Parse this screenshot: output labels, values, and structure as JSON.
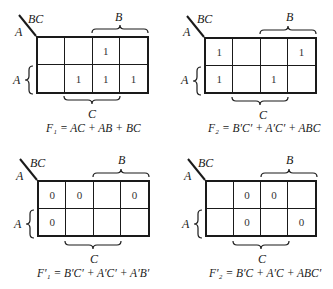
{
  "figure": {
    "axis_labels": {
      "column_var": "BC",
      "row_var": "A",
      "brace_top": "B",
      "brace_left": "A",
      "brace_bottom": "C"
    },
    "maps": [
      {
        "id": "F1",
        "equation": "F₁ = AC + AB + BC",
        "cells": [
          [
            "",
            "",
            "1",
            ""
          ],
          [
            "",
            "1",
            "1",
            "1"
          ]
        ]
      },
      {
        "id": "F2",
        "equation": "F₂ = B′C′ + A′C′ + ABC",
        "cells": [
          [
            "1",
            "",
            "",
            "1"
          ],
          [
            "1",
            "",
            "1",
            ""
          ]
        ]
      },
      {
        "id": "F1-complement",
        "equation": "F′₁ = B′C′ + A′C′ + A′B′",
        "cells": [
          [
            "0",
            "0",
            "",
            "0"
          ],
          [
            "0",
            "",
            "",
            ""
          ]
        ]
      },
      {
        "id": "F2-complement",
        "equation": "F′₂ = B′C + A′C + ABC′",
        "cells": [
          [
            "",
            "0",
            "0",
            ""
          ],
          [
            "",
            "0",
            "",
            "0"
          ]
        ]
      }
    ]
  }
}
